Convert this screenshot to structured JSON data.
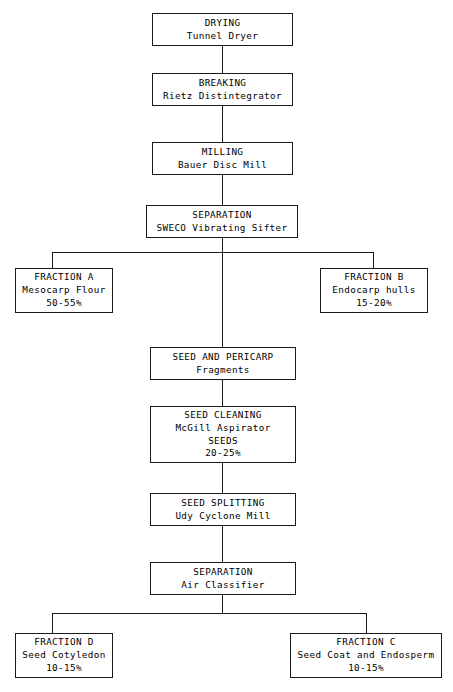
{
  "diagram": {
    "type": "process-flowchart",
    "background_color": "#ffffff",
    "line_color": "#1a1a1a",
    "nodes": [
      {
        "id": "drying",
        "lines": [
          "DRYING",
          "Tunnel Dryer"
        ],
        "x": 152,
        "y": 13,
        "w": 141,
        "h": 33
      },
      {
        "id": "breaking",
        "lines": [
          "BREAKING",
          "Rietz Distintegrator"
        ],
        "x": 152,
        "y": 73,
        "w": 141,
        "h": 33
      },
      {
        "id": "milling",
        "lines": [
          "MILLING",
          "Bauer Disc Mill"
        ],
        "x": 152,
        "y": 142,
        "w": 141,
        "h": 33
      },
      {
        "id": "separation-sifter",
        "lines": [
          "SEPARATION",
          "SWECO Vibrating Sifter"
        ],
        "x": 146,
        "y": 205,
        "w": 152,
        "h": 33
      },
      {
        "id": "fraction-a",
        "lines": [
          "FRACTION A",
          "Mesocarp Flour",
          "50-55%"
        ],
        "x": 15,
        "y": 268,
        "w": 98,
        "h": 45
      },
      {
        "id": "fraction-b",
        "lines": [
          "FRACTION B",
          "Endocarp hulls",
          "15-20%"
        ],
        "x": 320,
        "y": 268,
        "w": 108,
        "h": 45
      },
      {
        "id": "seed-and-pericarp",
        "lines": [
          "SEED AND PERICARP",
          "Fragments"
        ],
        "x": 150,
        "y": 347,
        "w": 146,
        "h": 33
      },
      {
        "id": "seed-cleaning",
        "lines": [
          "SEED CLEANING",
          "McGill Aspirator",
          "SEEDS",
          "20-25%"
        ],
        "x": 150,
        "y": 406,
        "w": 146,
        "h": 57
      },
      {
        "id": "seed-splitting",
        "lines": [
          "SEED SPLITTING",
          "Udy Cyclone Mill"
        ],
        "x": 150,
        "y": 493,
        "w": 146,
        "h": 33
      },
      {
        "id": "separation-air",
        "lines": [
          "SEPARATION",
          "Air Classifier"
        ],
        "x": 150,
        "y": 562,
        "w": 146,
        "h": 33
      },
      {
        "id": "fraction-d",
        "lines": [
          "FRACTION D",
          "Seed Cotyledon",
          "10-15%"
        ],
        "x": 15,
        "y": 633,
        "w": 98,
        "h": 45
      },
      {
        "id": "fraction-c",
        "lines": [
          "FRACTION C",
          "Seed Coat and Endosperm",
          "10-15%"
        ],
        "x": 290,
        "y": 633,
        "w": 152,
        "h": 45
      }
    ],
    "connectors": [
      {
        "id": "drying-to-breaking",
        "orient": "v",
        "x": 222,
        "y": 46,
        "len": 27
      },
      {
        "id": "breaking-to-milling",
        "orient": "v",
        "x": 222,
        "y": 106,
        "len": 36
      },
      {
        "id": "milling-to-separation",
        "orient": "v",
        "x": 222,
        "y": 175,
        "len": 30
      },
      {
        "id": "separation-to-split-stem",
        "orient": "v",
        "x": 222,
        "y": 238,
        "len": 14
      },
      {
        "id": "split-bar-top",
        "orient": "h",
        "x": 52,
        "y": 252,
        "len": 321
      },
      {
        "id": "drop-to-fraction-a",
        "orient": "v",
        "x": 52,
        "y": 252,
        "len": 16
      },
      {
        "id": "drop-to-fraction-b",
        "orient": "v",
        "x": 373,
        "y": 252,
        "len": 16
      },
      {
        "id": "split-center-to-pericarp",
        "orient": "v",
        "x": 222,
        "y": 252,
        "len": 95
      },
      {
        "id": "pericarp-to-cleaning",
        "orient": "v",
        "x": 222,
        "y": 380,
        "len": 26
      },
      {
        "id": "cleaning-to-splitting",
        "orient": "v",
        "x": 222,
        "y": 463,
        "len": 30
      },
      {
        "id": "splitting-to-separation",
        "orient": "v",
        "x": 222,
        "y": 526,
        "len": 36
      },
      {
        "id": "separation-to-split-stem2",
        "orient": "v",
        "x": 222,
        "y": 595,
        "len": 18
      },
      {
        "id": "split-bar-bottom",
        "orient": "h",
        "x": 52,
        "y": 613,
        "len": 314
      },
      {
        "id": "drop-to-fraction-d",
        "orient": "v",
        "x": 52,
        "y": 613,
        "len": 20
      },
      {
        "id": "drop-to-fraction-c",
        "orient": "v",
        "x": 366,
        "y": 613,
        "len": 20
      }
    ]
  }
}
